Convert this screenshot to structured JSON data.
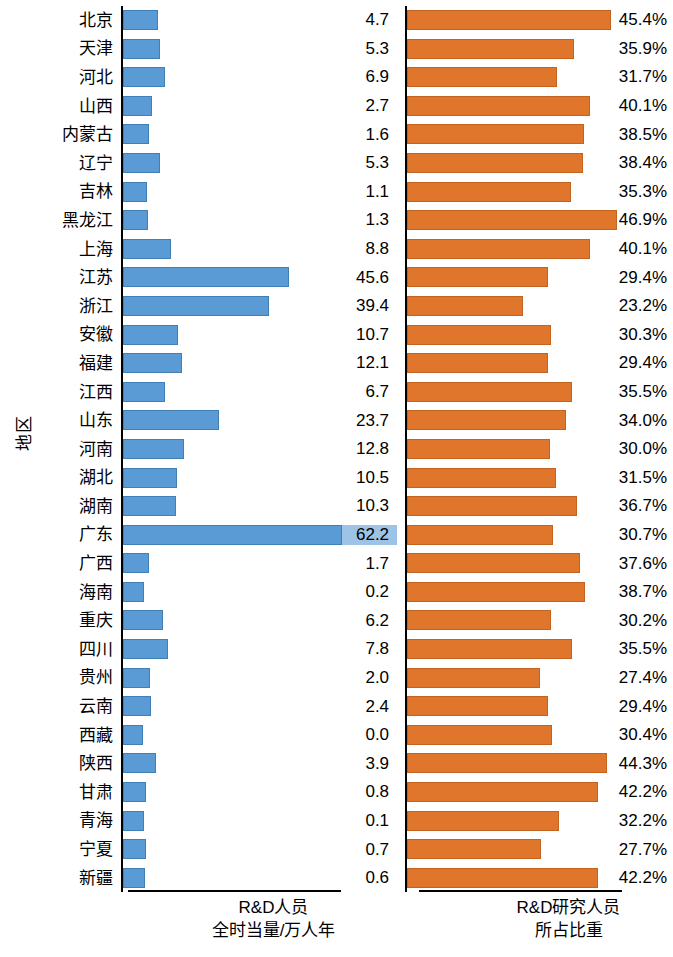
{
  "chart_data": {
    "type": "bar",
    "title": "",
    "ylabel": "地区",
    "legend_position": "none",
    "grid": false,
    "categories": [
      "北京",
      "天津",
      "河北",
      "山西",
      "内蒙古",
      "辽宁",
      "吉林",
      "黑龙江",
      "上海",
      "江苏",
      "浙江",
      "安徽",
      "福建",
      "江西",
      "山东",
      "河南",
      "湖北",
      "湖南",
      "广东",
      "广西",
      "海南",
      "重庆",
      "四川",
      "贵州",
      "云南",
      "西藏",
      "陕西",
      "甘肃",
      "青海",
      "宁夏",
      "新疆"
    ],
    "series": [
      {
        "name": "R&D人员全时当量/万人年",
        "unit": "万人年",
        "xlim": [
          0,
          65
        ],
        "values": [
          4.7,
          5.3,
          6.9,
          2.7,
          1.6,
          5.3,
          1.1,
          1.3,
          8.8,
          45.6,
          39.4,
          10.7,
          12.1,
          6.7,
          23.7,
          12.8,
          10.5,
          10.3,
          62.2,
          1.7,
          0.2,
          6.2,
          7.8,
          2.0,
          2.4,
          0.0,
          3.9,
          0.8,
          0.1,
          0.7,
          0.6
        ],
        "labels": [
          "4.7",
          "5.3",
          "6.9",
          "2.7",
          "1.6",
          "5.3",
          "1.1",
          "1.3",
          "8.8",
          "45.6",
          "39.4",
          "10.7",
          "12.1",
          "6.7",
          "23.7",
          "12.8",
          "10.5",
          "10.3",
          "62.2",
          "1.7",
          "0.2",
          "6.2",
          "7.8",
          "2.0",
          "2.4",
          "0.0",
          "3.9",
          "0.8",
          "0.1",
          "0.7",
          "0.6"
        ],
        "highlight_index": 18,
        "color": "#5b9bd5"
      },
      {
        "name": "R&D研究人员所占比重",
        "unit": "%",
        "xlim": [
          0,
          50
        ],
        "values": [
          45.4,
          35.9,
          31.7,
          40.1,
          38.5,
          38.4,
          35.3,
          46.9,
          40.1,
          29.4,
          23.2,
          30.3,
          29.4,
          35.5,
          34.0,
          30.0,
          31.5,
          36.7,
          30.7,
          37.6,
          38.7,
          30.2,
          35.5,
          27.4,
          29.4,
          30.4,
          44.3,
          42.2,
          32.2,
          27.7,
          42.2
        ],
        "labels": [
          "45.4%",
          "35.9%",
          "31.7%",
          "40.1%",
          "38.5%",
          "38.4%",
          "35.3%",
          "46.9%",
          "40.1%",
          "29.4%",
          "23.2%",
          "30.3%",
          "29.4%",
          "35.5%",
          "34.0%",
          "30.0%",
          "31.5%",
          "36.7%",
          "30.7%",
          "37.6%",
          "38.7%",
          "30.2%",
          "35.5%",
          "27.4%",
          "29.4%",
          "30.4%",
          "44.3%",
          "42.2%",
          "32.2%",
          "27.7%",
          "42.2%"
        ],
        "color": "#e0762b"
      }
    ]
  },
  "axes": {
    "y_title": "地区"
  },
  "footers": {
    "left_line1": "R&D人员",
    "left_line2": "全时当量/万人年",
    "right_line1": "R&D研究人员",
    "right_line2": "所占比重"
  },
  "colors": {
    "left_bar": "#5b9bd5",
    "right_bar": "#e0762b",
    "highlight": "#9dc3e6",
    "axis": "#000000"
  }
}
